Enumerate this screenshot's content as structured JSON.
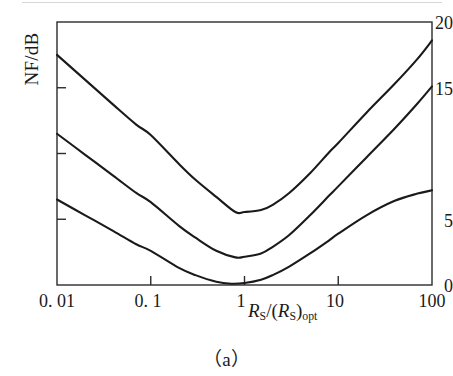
{
  "figure": {
    "caption": "（a）",
    "axes": {
      "ylabel": "NF/dB",
      "xlabel_prefix": "R",
      "xlabel_sub1": "S",
      "xlabel_mid": "/(R",
      "xlabel_sub2": "S",
      "xlabel_close": ")",
      "xlabel_sub3": "opt",
      "ytick_labels": [
        "20",
        "15",
        "",
        "5",
        "0"
      ],
      "xtick_labels": [
        "0. 01",
        "0. 1",
        "1",
        "10",
        "100"
      ]
    }
  },
  "chart_data": {
    "type": "line",
    "title": "（a）",
    "xlabel": "R_S/(R_S)_opt",
    "ylabel": "NF/dB",
    "xscale": "log",
    "yscale": "linear",
    "xlim": [
      0.01,
      100
    ],
    "ylim": [
      0,
      20
    ],
    "xticks": [
      0.01,
      0.1,
      1,
      10,
      100
    ],
    "xtick_labels": [
      "0. 01",
      "0. 1",
      "1",
      "10",
      "100"
    ],
    "yticks": [
      0,
      5,
      10,
      15,
      20
    ],
    "ytick_labels": [
      "0",
      "5",
      "",
      "15",
      "20"
    ],
    "grid": false,
    "legend": null,
    "line_color": "#1a1a1a",
    "line_width": 2.1,
    "series": [
      {
        "name": "upper-curve",
        "minimum_value": 5.5,
        "minimum_x": 0.8,
        "x": [
          0.01,
          0.02,
          0.04,
          0.07,
          0.1,
          0.2,
          0.3,
          0.5,
          0.8,
          1.0,
          1.5,
          2,
          3,
          5,
          8,
          10,
          20,
          40,
          70,
          100
        ],
        "values": [
          17.5,
          15.6,
          13.7,
          12.2,
          11.4,
          9.2,
          8.0,
          6.7,
          5.55,
          5.55,
          5.7,
          6.1,
          7.0,
          8.5,
          10.1,
          10.8,
          13.1,
          15.3,
          17.2,
          18.6
        ]
      },
      {
        "name": "middle-curve",
        "minimum_value": 2.1,
        "minimum_x": 0.8,
        "x": [
          0.01,
          0.02,
          0.04,
          0.07,
          0.1,
          0.2,
          0.3,
          0.5,
          0.8,
          1.0,
          1.5,
          2,
          3,
          5,
          8,
          10,
          20,
          40,
          70,
          100
        ],
        "values": [
          11.5,
          9.9,
          8.3,
          7.0,
          6.3,
          4.5,
          3.6,
          2.6,
          2.1,
          2.15,
          2.4,
          2.9,
          3.8,
          5.3,
          6.8,
          7.5,
          9.7,
          11.9,
          13.8,
          15.1
        ]
      },
      {
        "name": "lower-curve",
        "minimum_value": 0.1,
        "minimum_x": 0.72,
        "x": [
          0.01,
          0.02,
          0.04,
          0.07,
          0.1,
          0.2,
          0.3,
          0.5,
          0.72,
          1.0,
          1.5,
          2,
          3,
          5,
          8,
          10,
          20,
          40,
          70,
          100
        ],
        "values": [
          6.5,
          5.3,
          4.1,
          3.1,
          2.6,
          1.3,
          0.75,
          0.25,
          0.1,
          0.15,
          0.4,
          0.75,
          1.4,
          2.4,
          3.4,
          3.9,
          5.3,
          6.4,
          6.95,
          7.2
        ]
      }
    ]
  }
}
